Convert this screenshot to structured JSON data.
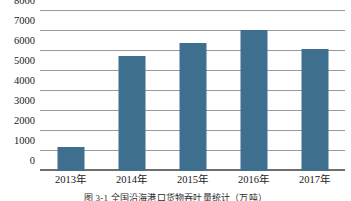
{
  "chart_data": {
    "type": "bar",
    "title": "",
    "xlabel": "",
    "ylabel": "",
    "categories": [
      "2013年",
      "2014年",
      "2015年",
      "2016年",
      "2017年"
    ],
    "values": [
      1200,
      5750,
      6400,
      7050,
      6100
    ],
    "ylim": [
      0,
      8000
    ],
    "ytick_values": [
      8000,
      7000,
      6000,
      5000,
      4000,
      3000,
      2000,
      1000,
      0
    ],
    "ytick_labels": [
      "8000",
      "7000",
      "6000",
      "5000",
      "4000",
      "3000",
      "2000",
      "1000",
      "0"
    ],
    "grid": true,
    "legend": false,
    "bar_color": "#3f6f8f",
    "gridline_color": "#9a9a9a",
    "axis_color": "#6f6f6f",
    "text_color": "#1a1a1a"
  },
  "caption": {
    "text": "图 3-1 全国沿海港口货物吞吐量统计（万吨）"
  }
}
